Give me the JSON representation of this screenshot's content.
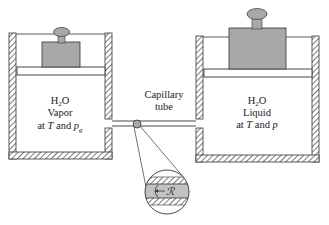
{
  "left_container": {
    "line1": "H",
    "line1_sub": "2",
    "line1_tail": "O",
    "line2": "Vapor",
    "line3_prefix": "at ",
    "line3_T": "T",
    "line3_mid": " and ",
    "line3_p": "p",
    "line3_sub": "g"
  },
  "right_container": {
    "line1": "H",
    "line1_sub": "2",
    "line1_tail": "O",
    "line2": "Liquid",
    "line3_prefix": "at ",
    "line3_T": "T",
    "line3_mid": " and ",
    "line3_p": "p"
  },
  "capillary": {
    "line1": "Capillary",
    "line2": "tube"
  },
  "magnified_view": {
    "radius_symbol": "ℛ"
  },
  "colors": {
    "weight_fill": "#a8a8a8",
    "liquid_fill": "#c2c2c2",
    "stroke": "#333333"
  }
}
